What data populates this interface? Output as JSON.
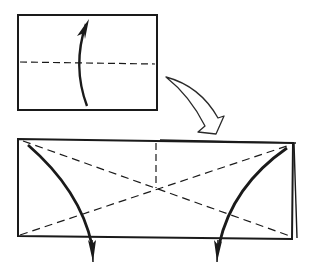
{
  "diagram": {
    "type": "origami-instruction",
    "background": "#ffffff",
    "ink": "#1a1a1a",
    "steps": [
      {
        "id": "step-1",
        "description": "Rectangle with horizontal valley-fold dashed line; curved arrow folding bottom half up",
        "paper": {
          "x": 18,
          "y": 15,
          "w": 139,
          "h": 95
        },
        "fold_line": "horizontal-dashed",
        "arrow": "fold-up-curved"
      },
      {
        "id": "transition",
        "description": "Hollow curved arrow pointing to next step",
        "arrow": "hollow-curved-down-right"
      },
      {
        "id": "step-2",
        "description": "Long folded rectangle with diagonal dashed crease lines forming an X, a vertical dashed line to the center, and two curved arrows folding corners down",
        "paper": {
          "x": 18,
          "y": 139,
          "w": 276,
          "h": 99
        },
        "fold_lines": [
          "diagonal-dashed",
          "diagonal-dashed",
          "vertical-dashed-center"
        ],
        "arrows": [
          "left-corner-fold-down",
          "right-corner-fold-down"
        ]
      }
    ]
  }
}
